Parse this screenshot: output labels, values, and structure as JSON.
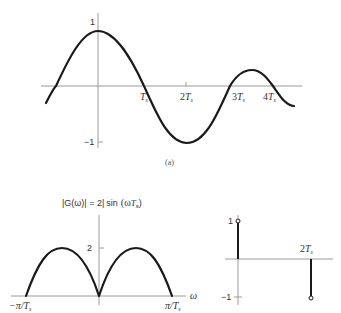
{
  "figure_a": {
    "caption": "(a)",
    "y_labels": {
      "top": "1",
      "bottom": "−1"
    },
    "x_labels": [
      {
        "main": "T",
        "sub": "s",
        "prefix": ""
      },
      {
        "main": "T",
        "sub": "s",
        "prefix": "2"
      },
      {
        "main": "T",
        "sub": "s",
        "prefix": "3"
      },
      {
        "main": "T",
        "sub": "s",
        "prefix": "4"
      }
    ],
    "description": "Sinc-like waveform: peak 1 at t=0, zero crossing at Ts, minimum −1 at 2Ts, zero crossing at 3Ts, small positive lobe, zero crossing at 4Ts"
  },
  "figure_b": {
    "title_left": "|G(ω)| = 2|",
    "title_func": "sin",
    "title_arg_pre": "(ω",
    "title_arg_T": "T",
    "title_arg_sub": "s",
    "title_arg_post": ")",
    "y_tick": "2",
    "x_axis_label": "ω",
    "x_left": {
      "prefix": "−π/",
      "main": "T",
      "sub": "s"
    },
    "x_right": {
      "prefix": "π/",
      "main": "T",
      "sub": "s"
    }
  },
  "figure_c": {
    "y_top": "1",
    "y_bottom": "−1",
    "stem_label": {
      "prefix": "2",
      "main": "T",
      "sub": "s"
    },
    "stems": [
      {
        "t": 0,
        "value": 1
      },
      {
        "t": "2Ts",
        "value": -1
      }
    ]
  }
}
